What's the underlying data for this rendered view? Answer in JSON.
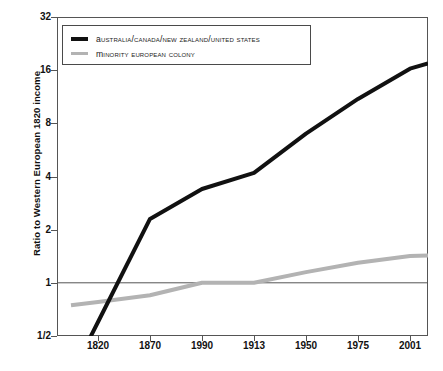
{
  "chart_data": {
    "type": "line",
    "title": "",
    "xlabel": "",
    "ylabel": "Ratio to Western European 1820 income",
    "x_categories": [
      "1820",
      "1870",
      "1990",
      "1913",
      "1950",
      "1975",
      "2001"
    ],
    "y_ticks": [
      "1/2",
      "1",
      "2",
      "4",
      "8",
      "16",
      "32"
    ],
    "y_tick_values": [
      0.5,
      1,
      2,
      4,
      8,
      16,
      32
    ],
    "yscale": "log2",
    "ylim": [
      0.5,
      32
    ],
    "grid": false,
    "legend_position": "top-left-inside",
    "reference_line": 1,
    "series": [
      {
        "name": "Australia/Canada/New Zealand/United States",
        "color": "#111111",
        "values": [
          0.6,
          2.3,
          3.4,
          4.2,
          7.0,
          11.0,
          16.3
        ],
        "end_value": 17.5
      },
      {
        "name": "Minority European colony",
        "color": "#b3b3b3",
        "values": [
          0.78,
          0.85,
          1.0,
          1.0,
          1.15,
          1.3,
          1.42
        ],
        "end_value": 1.43
      }
    ]
  },
  "axis": {
    "y_title": "Ratio to Western European 1820 income",
    "y_labels": [
      "32",
      "16",
      "8",
      "4",
      "2",
      "1",
      "1/2"
    ],
    "x_labels": [
      "1820",
      "1870",
      "1990",
      "1913",
      "1950",
      "1975",
      "2001"
    ]
  },
  "legend": {
    "items": [
      {
        "label": "Australia/Canada/New Zealand/United States",
        "swatch": "dark"
      },
      {
        "label": "Minority European colony",
        "swatch": "gray"
      }
    ]
  },
  "colors": {
    "series_dark": "#111111",
    "series_gray": "#b3b3b3",
    "frame": "#555555",
    "background": "#ffffff"
  }
}
